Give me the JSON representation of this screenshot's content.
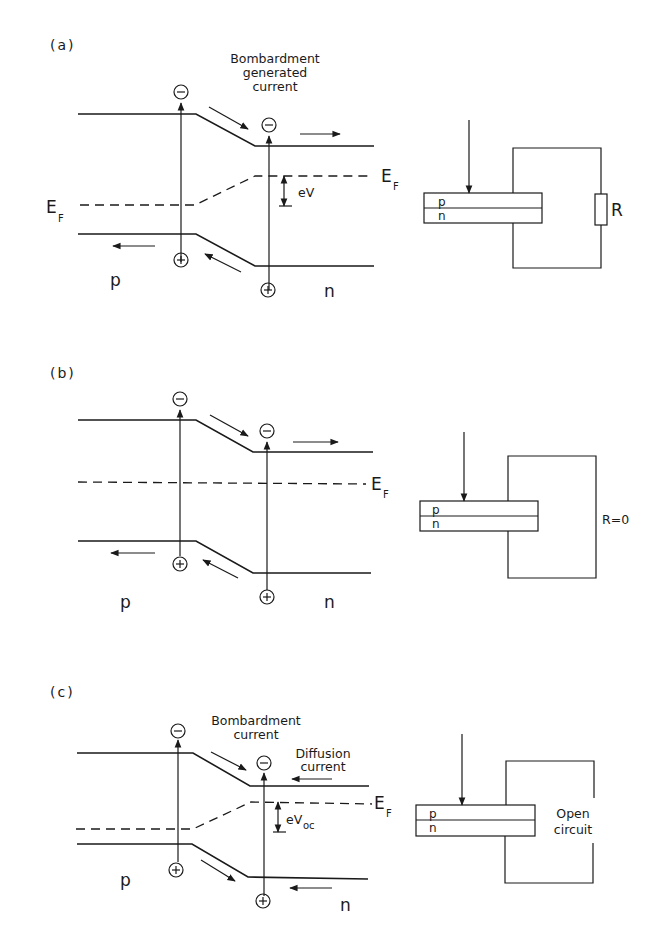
{
  "figure": {
    "panels": [
      {
        "id": "a",
        "label": "(a)",
        "annotation": [
          "Bombardment",
          "generated",
          "current"
        ],
        "fermi_label_left": "E",
        "fermi_label_right": "E",
        "fermi_sub": "F",
        "voltage_label": "eV",
        "voltage_sub": "",
        "p_label": "p",
        "n_label": "n",
        "device_p": "p",
        "device_n": "n",
        "load_label": "R"
      },
      {
        "id": "b",
        "label": "(b)",
        "fermi_label_right": "E",
        "fermi_sub": "F",
        "p_label": "p",
        "n_label": "n",
        "device_p": "p",
        "device_n": "n",
        "load_label": "R=0"
      },
      {
        "id": "c",
        "label": "(c)",
        "annotation": [
          "Bombardment",
          "current"
        ],
        "annotation2": [
          "Diffusion",
          "current"
        ],
        "fermi_label_right": "E",
        "fermi_sub": "F",
        "voltage_label": "eV",
        "voltage_sub": "oc",
        "p_label": "p",
        "n_label": "n",
        "device_p": "p",
        "device_n": "n",
        "load_label": [
          "Open",
          "circuit"
        ]
      }
    ],
    "symbols": {
      "electron": "−",
      "hole": "+"
    }
  }
}
